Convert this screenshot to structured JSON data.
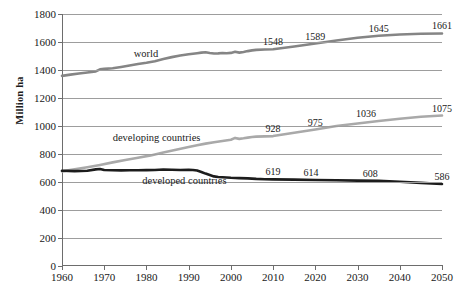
{
  "chart_data": {
    "type": "line",
    "title": "",
    "xlabel": "",
    "ylabel": "Million ha",
    "xlim": [
      1960,
      2050
    ],
    "ylim": [
      0,
      1800
    ],
    "grid": true,
    "legend_position": "inline-on-series",
    "xticks": [
      1960,
      1970,
      1980,
      1990,
      2000,
      2010,
      2020,
      2030,
      2040,
      2050
    ],
    "yticks": [
      0,
      200,
      400,
      600,
      800,
      1000,
      1200,
      1400,
      1600,
      1800
    ],
    "xtick_labels": [
      "1960",
      "1970",
      "1980",
      "1990",
      "2000",
      "2010",
      "2020",
      "2030",
      "2040",
      "2050"
    ],
    "ytick_labels": [
      "0",
      "200",
      "400",
      "600",
      "800",
      "1000",
      "1200",
      "1400",
      "1600",
      "1800"
    ],
    "series": [
      {
        "name": "world",
        "color": "#858585",
        "width": 2.6,
        "label_x": 1977,
        "label_y": 1505,
        "x": [
          1960,
          1962,
          1964,
          1966,
          1968,
          1969,
          1970,
          1972,
          1974,
          1976,
          1978,
          1980,
          1982,
          1984,
          1986,
          1988,
          1990,
          1992,
          1993,
          1994,
          1995,
          1996,
          1997,
          1998,
          1999,
          2000,
          2001,
          2002,
          2003,
          2004,
          2005,
          2006,
          2008,
          2010,
          2015,
          2020,
          2025,
          2030,
          2035,
          2040,
          2045,
          2050
        ],
        "y": [
          1358,
          1367,
          1375,
          1382,
          1390,
          1405,
          1408,
          1413,
          1422,
          1432,
          1443,
          1452,
          1463,
          1478,
          1492,
          1503,
          1512,
          1520,
          1524,
          1527,
          1522,
          1518,
          1519,
          1521,
          1520,
          1522,
          1530,
          1524,
          1529,
          1535,
          1540,
          1544,
          1546,
          1548,
          1568,
          1589,
          1611,
          1630,
          1645,
          1654,
          1659,
          1661
        ],
        "labels": [
          {
            "x": 2010,
            "y": 1548,
            "text": "1548"
          },
          {
            "x": 2020,
            "y": 1589,
            "text": "1589"
          },
          {
            "x": 2035,
            "y": 1645,
            "text": "1645"
          },
          {
            "x": 2050,
            "y": 1661,
            "text": "1661"
          }
        ]
      },
      {
        "name": "developing countries",
        "color": "#a9a9a9",
        "width": 2.6,
        "label_x": 1972,
        "label_y": 905,
        "x": [
          1960,
          1963,
          1966,
          1969,
          1972,
          1975,
          1978,
          1981,
          1984,
          1987,
          1990,
          1992,
          1994,
          1996,
          1998,
          2000,
          2001,
          2002,
          2003,
          2004,
          2005,
          2006,
          2008,
          2010,
          2015,
          2020,
          2025,
          2030,
          2035,
          2040,
          2045,
          2050
        ],
        "y": [
          676,
          691,
          706,
          722,
          740,
          757,
          773,
          790,
          810,
          830,
          850,
          862,
          874,
          884,
          893,
          902,
          915,
          908,
          912,
          917,
          921,
          924,
          926,
          928,
          952,
          975,
          1000,
          1018,
          1036,
          1052,
          1066,
          1075
        ],
        "labels": [
          {
            "x": 2010,
            "y": 928,
            "text": "928"
          },
          {
            "x": 2020,
            "y": 975,
            "text": "975"
          },
          {
            "x": 2032,
            "y": 1036,
            "text": "1036"
          },
          {
            "x": 2050,
            "y": 1075,
            "text": "1075"
          }
        ]
      },
      {
        "name": "developed countries",
        "color": "#1c1c1c",
        "width": 2.6,
        "label_x": 1979,
        "label_y": 600,
        "x": [
          1960,
          1963,
          1966,
          1968,
          1969,
          1970,
          1972,
          1974,
          1976,
          1978,
          1980,
          1982,
          1984,
          1986,
          1988,
          1990,
          1991,
          1992,
          1993,
          1994,
          1995,
          1996,
          1997,
          1998,
          2000,
          2002,
          2004,
          2006,
          2008,
          2010,
          2015,
          2020,
          2025,
          2030,
          2035,
          2040,
          2045,
          2050
        ],
        "y": [
          680,
          678,
          680,
          690,
          693,
          686,
          684,
          683,
          684,
          684,
          685,
          686,
          689,
          688,
          686,
          687,
          686,
          682,
          672,
          660,
          650,
          640,
          636,
          634,
          630,
          628,
          626,
          622,
          620,
          619,
          617,
          614,
          612,
          610,
          608,
          602,
          594,
          586
        ],
        "labels": [
          {
            "x": 2010,
            "y": 619,
            "text": "619"
          },
          {
            "x": 2019,
            "y": 614,
            "text": "614"
          },
          {
            "x": 2033,
            "y": 608,
            "text": "608"
          },
          {
            "x": 2050,
            "y": 586,
            "text": "586"
          }
        ]
      }
    ]
  }
}
